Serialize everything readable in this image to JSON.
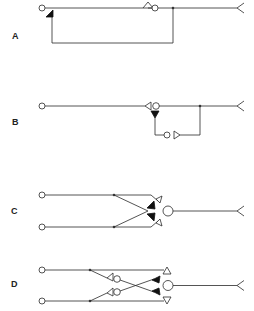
{
  "diagram": {
    "panels": [
      {
        "id": "A",
        "label": "A",
        "label_pos": [
          12,
          31
        ]
      },
      {
        "id": "B",
        "label": "B",
        "label_pos": [
          12,
          117
        ]
      },
      {
        "id": "C",
        "label": "C",
        "label_pos": [
          11,
          206
        ]
      },
      {
        "id": "D",
        "label": "D",
        "label_pos": [
          11,
          279
        ]
      }
    ],
    "colors": {
      "line": "#2a2a2a",
      "background": "#ffffff"
    }
  }
}
